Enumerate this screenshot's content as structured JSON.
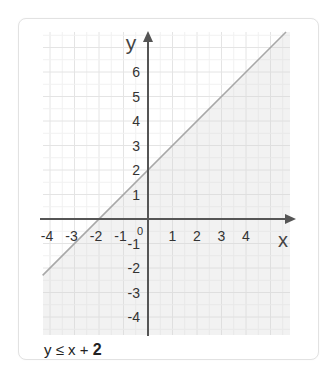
{
  "chart_data": {
    "type": "line",
    "title": "",
    "xlabel": "x",
    "ylabel": "y",
    "xlim": [
      -4.3,
      5.8
    ],
    "ylim": [
      -4.5,
      7.7
    ],
    "grid": true,
    "x_ticks": [
      "-4",
      "-3",
      "-2",
      "-1",
      "1",
      "2",
      "3",
      "4"
    ],
    "y_ticks": [
      "6",
      "5",
      "4",
      "3",
      "2",
      "1",
      "-1",
      "-2",
      "-3",
      "-4"
    ],
    "origin_label": "0",
    "series": [
      {
        "name": "y = x + 2",
        "x": [
          -4.3,
          5.8
        ],
        "y": [
          -2.3,
          7.8
        ],
        "style": "solid boundary line"
      }
    ],
    "shaded_region": "below line (y ≤ x + 2)",
    "annotation": "y ≤ x + 2"
  },
  "colors": {
    "shade": "#eeeeee",
    "grid": "#e6e6e6",
    "axis": "#555555",
    "boundary": "#a9a9a9",
    "text": "#333333"
  },
  "caption": {
    "lhs": "y ≤ x + ",
    "rhs": "2"
  }
}
